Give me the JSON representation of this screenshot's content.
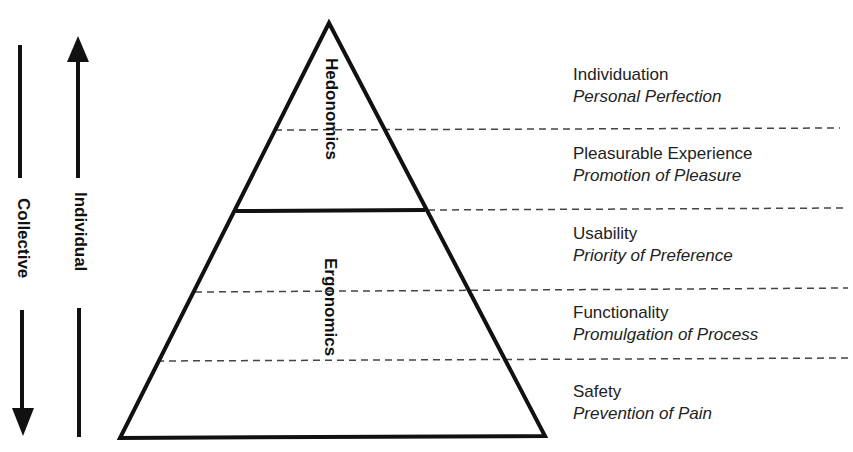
{
  "axes": {
    "collective_label": "Collective",
    "collective_direction": "down",
    "individual_label": "Individual",
    "individual_direction": "up"
  },
  "pyramid": {
    "upper_section_label": "Hedonomics",
    "lower_section_label": "Ergonomics"
  },
  "levels": [
    {
      "title": "Individuation",
      "subtitle": "Personal Perfection"
    },
    {
      "title": "Pleasurable Experience",
      "subtitle": "Promotion of Pleasure"
    },
    {
      "title": "Usability",
      "subtitle": "Priority of Preference"
    },
    {
      "title": "Functionality",
      "subtitle": "Promulgation of Process"
    },
    {
      "title": "Safety",
      "subtitle": "Prevention of Pain"
    }
  ],
  "colors": {
    "line": "#111111",
    "dashed": "#444444",
    "text": "#222222"
  }
}
